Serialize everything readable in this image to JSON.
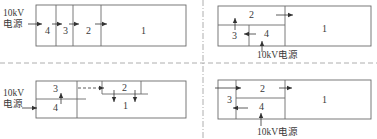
{
  "figure": {
    "colors": {
      "line": "#6b6b6b",
      "text": "#3a3a3a",
      "divider": "#9a9a9a"
    },
    "panels": [
      {
        "id": "top-left",
        "source_label_line1": "10kV",
        "source_label_line2": "电源",
        "zones": [
          "4",
          "3",
          "2",
          "1"
        ]
      },
      {
        "id": "top-right",
        "source_label": "10kV电源",
        "zones": [
          "2",
          "3",
          "4",
          "1"
        ]
      },
      {
        "id": "bottom-left",
        "source_label_line1": "10kV",
        "source_label_line2": "电源",
        "zones": [
          "3",
          "4",
          "2",
          "1"
        ]
      },
      {
        "id": "bottom-right",
        "source_label": "10kV电源",
        "zones": [
          "2",
          "3",
          "4",
          "1"
        ]
      }
    ]
  }
}
